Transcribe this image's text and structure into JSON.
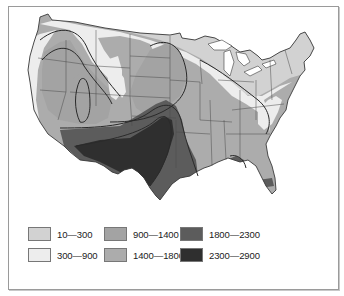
{
  "map": {
    "region": "Contiguous United States",
    "type": "choropleth",
    "colors": {
      "outline": "#3a3a3a",
      "state_border": "#4a4a4a",
      "background": "#ffffff"
    }
  },
  "legend": {
    "items": [
      {
        "label": "10—300",
        "color": "#d2d2d2"
      },
      {
        "label": "300—900",
        "color": "#ededed"
      },
      {
        "label": "900—1400",
        "color": "#a3a3a3"
      },
      {
        "label": "1400—1800",
        "color": "#acacac"
      },
      {
        "label": "1800—2300",
        "color": "#5c5c5c"
      },
      {
        "label": "2300—2900",
        "color": "#2f2f2f"
      }
    ]
  }
}
